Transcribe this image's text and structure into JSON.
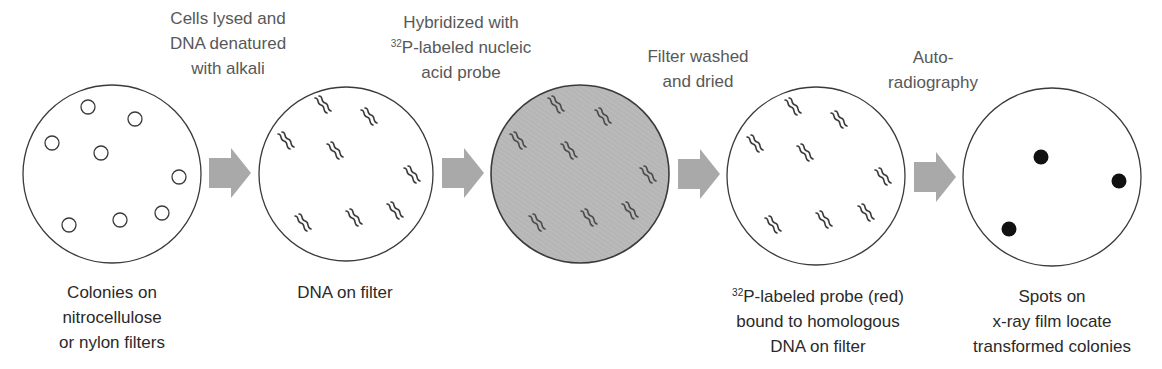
{
  "colors": {
    "stroke": "#3a3a3a",
    "arrow_fill": "#a9a9a9",
    "probe_filter_fill": "#b6b6b6",
    "probe_squiggle": "#4a4a4a",
    "dna_squiggle": "#3a3a3a",
    "spot": "#111111",
    "top_text": "#585858",
    "bottom_text": "#2a2a2a"
  },
  "steps": [
    {
      "label": {
        "lines": [
          "Colonies on",
          "nitrocellulose",
          "or nylon filters"
        ]
      },
      "filter": {
        "cx": 112,
        "cy": 174,
        "r": 89,
        "fill": "#ffffff",
        "content": "colonies",
        "items": [
          [
            88,
            107
          ],
          [
            135,
            119
          ],
          [
            52,
            143
          ],
          [
            101,
            153
          ],
          [
            179,
            177
          ],
          [
            69,
            225
          ],
          [
            120,
            220
          ],
          [
            162,
            213
          ]
        ]
      }
    },
    {
      "label": {
        "lines": [
          "DNA on filter"
        ]
      },
      "filter": {
        "cx": 346,
        "cy": 174,
        "r": 87,
        "fill": "#ffffff",
        "content": "dna",
        "items": [
          [
            322,
            107
          ],
          [
            368,
            119
          ],
          [
            285,
            143
          ],
          [
            334,
            153
          ],
          [
            411,
            177
          ],
          [
            302,
            225
          ],
          [
            353,
            220
          ],
          [
            394,
            213
          ]
        ]
      }
    },
    {
      "label": {
        "lines": []
      },
      "filter": {
        "cx": 580,
        "cy": 174,
        "r": 89,
        "fill": "#b6b6b6",
        "content": "probe",
        "items": [
          [
            555,
            107
          ],
          [
            602,
            119
          ],
          [
            517,
            143
          ],
          [
            568,
            153
          ],
          [
            647,
            177
          ],
          [
            536,
            225
          ],
          [
            588,
            220
          ],
          [
            629,
            213
          ]
        ]
      }
    },
    {
      "label": {
        "sup": "32",
        "lines": [
          "P-labeled probe (red)",
          "bound to homologous",
          "DNA on filter"
        ]
      },
      "filter": {
        "cx": 816,
        "cy": 176,
        "r": 89,
        "fill": "#ffffff",
        "content": "dna",
        "items": [
          [
            792,
            109
          ],
          [
            838,
            122
          ],
          [
            754,
            146
          ],
          [
            804,
            155
          ],
          [
            882,
            179
          ],
          [
            772,
            227
          ],
          [
            823,
            222
          ],
          [
            865,
            215
          ]
        ]
      }
    },
    {
      "label": {
        "lines": [
          "Spots on",
          "x-ray film locate",
          "transformed colonies"
        ]
      },
      "filter": {
        "cx": 1052,
        "cy": 177,
        "r": 89,
        "fill": "#ffffff",
        "content": "spots",
        "items": [
          [
            1041,
            157
          ],
          [
            1119,
            181
          ],
          [
            1009,
            229
          ]
        ]
      }
    }
  ],
  "transitions": [
    {
      "label": {
        "lines": [
          "Cells lysed and",
          "DNA denatured",
          "with alkali"
        ]
      },
      "arrow": {
        "x": 209,
        "cy": 173
      }
    },
    {
      "label": {
        "sup": "32",
        "lines": [
          "Hybridized with",
          "P-labeled nucleic",
          "acid probe"
        ]
      },
      "arrow": {
        "x": 442,
        "cy": 173
      }
    },
    {
      "label": {
        "lines": [
          "Filter washed",
          "and dried"
        ]
      },
      "arrow": {
        "x": 678,
        "cy": 174
      }
    },
    {
      "label": {
        "lines": [
          "Auto-",
          "radiography"
        ]
      },
      "arrow": {
        "x": 914,
        "cy": 177
      }
    }
  ]
}
